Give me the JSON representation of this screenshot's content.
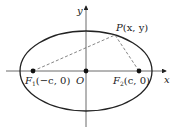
{
  "diagram": {
    "type": "ellipse-foci",
    "axes": {
      "x_label": "x",
      "y_label": "y"
    },
    "origin_label": "O",
    "focus1": {
      "name": "F",
      "subscript": "1",
      "coords": "(−c, 0)"
    },
    "focus2": {
      "name": "F",
      "subscript": "2",
      "coords": "(c, 0)"
    },
    "point": {
      "name": "P",
      "coords": "(x, y)"
    },
    "colors": {
      "stroke": "#222222",
      "dashed": "#555555"
    }
  }
}
